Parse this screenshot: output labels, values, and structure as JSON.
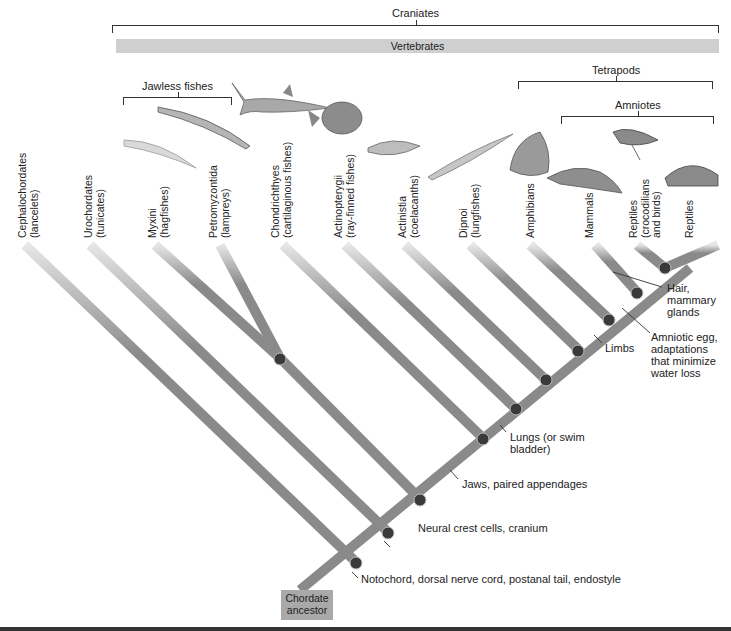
{
  "groups": {
    "craniates": "Craniates",
    "vertebrates": "Vertebrates",
    "jawless_fishes": "Jawless fishes",
    "tetrapods": "Tetrapods",
    "amniotes": "Amniotes"
  },
  "taxa": [
    {
      "name": "Cephalochordates",
      "common": "(lancelets)",
      "icon": "none"
    },
    {
      "name": "Urochordates",
      "common": "(tunicates)",
      "icon": "none"
    },
    {
      "name": "Myxini",
      "common": "(hagfishes)",
      "icon": "hagfish-icon"
    },
    {
      "name": "Petromyzontida",
      "common": "(lampreys)",
      "icon": "lamprey-icon"
    },
    {
      "name": "Chondrichthyes",
      "common": "(cartilaginous fishes)",
      "icon": "shark-icon"
    },
    {
      "name": "Actinopterygii",
      "common": "(ray-finned fishes)",
      "icon": "ray-finned-fish-icon"
    },
    {
      "name": "Actinistia",
      "common": "(coelacanths)",
      "icon": "coelacanth-icon"
    },
    {
      "name": "Dipnoi",
      "common": "(lungfishes)",
      "icon": "lungfish-icon"
    },
    {
      "name": "Amphibians",
      "common": "",
      "icon": "frog-icon"
    },
    {
      "name": "Mammals",
      "common": "",
      "icon": "platypus-icon"
    },
    {
      "name": "Reptiles",
      "common": "(crocodilians",
      "common2": "and birds)",
      "icon": "bird-icon"
    },
    {
      "name": "Reptiles",
      "common": "",
      "icon": "tortoise-icon"
    }
  ],
  "traits": {
    "notochord": "Notochord, dorsal nerve cord, postanal tail, endostyle",
    "neural_crest": "Neural crest cells, cranium",
    "jaws": "Jaws, paired appendages",
    "lungs_1": "Lungs (or swim",
    "lungs_2": "bladder)",
    "limbs": "Limbs",
    "amniotic_1": "Amniotic egg,",
    "amniotic_2": "adaptations",
    "amniotic_3": "that minimize",
    "amniotic_4": "water loss",
    "hair_1": "Hair,",
    "hair_2": "mammary",
    "hair_3": "glands"
  },
  "root": {
    "line1": "Chordate",
    "line2": "ancestor"
  },
  "colors": {
    "branch": "#8a8a8a",
    "node": "#3a3a3a",
    "vertebrates_bar": "#cfcfcf",
    "ancestor_box": "#a9a9a9"
  }
}
